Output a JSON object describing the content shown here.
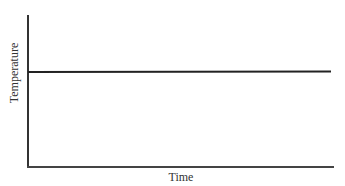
{
  "chart_data": {
    "type": "line",
    "title": "",
    "xlabel": "Time",
    "ylabel": "Temperature",
    "x": [
      0,
      1
    ],
    "series": [
      {
        "name": "Temperature",
        "values": [
          0.62,
          0.62
        ]
      }
    ],
    "xlim": [
      0,
      1
    ],
    "ylim": [
      0,
      1
    ],
    "grid": false,
    "legend": null,
    "tick_labels": false,
    "colors": {
      "line": "#222222",
      "axes": "#333333"
    }
  }
}
